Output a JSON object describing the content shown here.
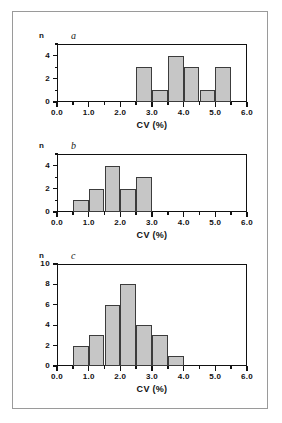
{
  "figure": {
    "background": "#ffffff",
    "frame_color": "#9a9a9a",
    "bar_fill": "#c6c6c6",
    "bar_stroke": "#3c3c3c",
    "axis_color": "#111111",
    "count_symbol": "n",
    "axis_title": "CV (%)"
  },
  "panels": [
    {
      "letter": "a",
      "count_symbol": "n",
      "axis_title": "CV (%)",
      "ylabels": [
        "0",
        "2",
        "4"
      ],
      "xlabels": [
        "0.0",
        "1.0",
        "2.0",
        "3.0",
        "4.0",
        "5.0",
        "6.0"
      ]
    },
    {
      "letter": "b",
      "count_symbol": "n",
      "axis_title": "CV (%)",
      "ylabels": [
        "0",
        "2",
        "4"
      ],
      "xlabels": [
        "0.0",
        "1.0",
        "2.0",
        "3.0",
        "4.0",
        "5.0",
        "6.0"
      ]
    },
    {
      "letter": "c",
      "count_symbol": "n",
      "axis_title": "CV (%)",
      "ylabels": [
        "0",
        "2",
        "4",
        "6",
        "8",
        "10"
      ],
      "xlabels": [
        "0.0",
        "1.0",
        "2.0",
        "3.0",
        "4.0",
        "5.0",
        "6.0"
      ]
    }
  ],
  "chart_data": [
    {
      "type": "bar",
      "title": "a",
      "xlabel": "CV (%)",
      "ylabel": "n",
      "xlim": [
        0.0,
        6.0
      ],
      "ylim": [
        0,
        5
      ],
      "bin_width": 0.5,
      "grid": false,
      "legend": "none",
      "xticks": [
        0.0,
        1.0,
        2.0,
        3.0,
        4.0,
        5.0,
        6.0
      ],
      "xminor_step": 0.5,
      "yticks": [
        0,
        2,
        4
      ],
      "yminor_step": 1,
      "bin_edges": [
        2.5,
        3.0,
        3.5,
        4.0,
        4.5,
        5.0,
        5.5
      ],
      "categories": [
        "2.5-3.0",
        "3.0-3.5",
        "3.5-4.0",
        "4.0-4.5",
        "4.5-5.0",
        "5.0-5.5"
      ],
      "values": [
        3,
        1,
        4,
        3,
        1,
        3
      ]
    },
    {
      "type": "bar",
      "title": "b",
      "xlabel": "CV (%)",
      "ylabel": "n",
      "xlim": [
        0.0,
        6.0
      ],
      "ylim": [
        0,
        5
      ],
      "bin_width": 0.5,
      "grid": false,
      "legend": "none",
      "xticks": [
        0.0,
        1.0,
        2.0,
        3.0,
        4.0,
        5.0,
        6.0
      ],
      "xminor_step": 0.5,
      "yticks": [
        0,
        2,
        4
      ],
      "yminor_step": 1,
      "bin_edges": [
        0.5,
        1.0,
        1.5,
        2.0,
        2.5,
        3.0
      ],
      "categories": [
        "0.5-1.0",
        "1.0-1.5",
        "1.5-2.0",
        "2.0-2.5",
        "2.5-3.0"
      ],
      "values": [
        1,
        2,
        4,
        2,
        3
      ]
    },
    {
      "type": "bar",
      "title": "c",
      "xlabel": "CV (%)",
      "ylabel": "n",
      "xlim": [
        0.0,
        6.0
      ],
      "ylim": [
        0,
        10
      ],
      "bin_width": 0.5,
      "grid": false,
      "legend": "none",
      "xticks": [
        0.0,
        1.0,
        2.0,
        3.0,
        4.0,
        5.0,
        6.0
      ],
      "xminor_step": 0.5,
      "yticks": [
        0,
        2,
        4,
        6,
        8,
        10
      ],
      "yminor_step": 2,
      "bin_edges": [
        0.5,
        1.0,
        1.5,
        2.0,
        2.5,
        3.0,
        3.5,
        4.0
      ],
      "categories": [
        "0.5-1.0",
        "1.0-1.5",
        "1.5-2.0",
        "2.0-2.5",
        "2.5-3.0",
        "3.0-3.5",
        "3.5-4.0"
      ],
      "values": [
        2,
        3,
        6,
        8,
        4,
        3,
        1
      ]
    }
  ]
}
